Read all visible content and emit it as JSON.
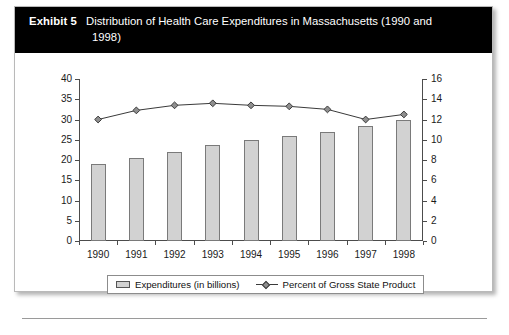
{
  "exhibit": {
    "label": "Exhibit 5",
    "title_line1": "Distribution of Health Care Expenditures in Massachusetts (1990 and",
    "title_line2": "1998)"
  },
  "legend": {
    "bar_label": "Expenditures (in billions)",
    "line_label": "Percent of Gross State Product",
    "bar_swatch_icon": "bar-swatch-icon",
    "line_swatch_icon": "line-diamond-swatch-icon"
  },
  "axes": {
    "left_ticks": [
      "40",
      "35",
      "30",
      "25",
      "20",
      "15",
      "10",
      "5",
      "0"
    ],
    "right_ticks": [
      "16",
      "14",
      "12",
      "10",
      "8",
      "6",
      "4",
      "2",
      "0"
    ]
  },
  "colors": {
    "header_background": "#000000",
    "header_text": "#ffffff",
    "bar_fill": "#d2d2d2",
    "bar_stroke": "#7a7a7a",
    "line_stroke": "#3a3a3a",
    "marker_fill": "#8f8f8f",
    "axis": "#4c4c4c",
    "page_background": "#ffffff"
  },
  "chart_data": {
    "type": "bar",
    "title": "Distribution of Health Care Expenditures in Massachusetts (1990 and 1998)",
    "xlabel": "",
    "ylabel": "",
    "categories": [
      "1990",
      "1991",
      "1992",
      "1993",
      "1994",
      "1995",
      "1996",
      "1997",
      "1998"
    ],
    "series": [
      {
        "name": "Expenditures (in billions)",
        "type": "bar",
        "axis": "left",
        "values": [
          19.0,
          20.5,
          22.0,
          23.7,
          25.0,
          26.0,
          27.0,
          28.4,
          30.0
        ]
      },
      {
        "name": "Percent of Gross State Product",
        "type": "line",
        "axis": "right",
        "values": [
          12.0,
          12.9,
          13.4,
          13.6,
          13.4,
          13.3,
          13.0,
          12.0,
          12.5
        ]
      }
    ],
    "ylim": [
      0,
      40
    ],
    "y2lim": [
      0,
      16
    ],
    "ytick_step": 5,
    "y2tick_step": 2,
    "grid": false,
    "legend_position": "bottom"
  }
}
